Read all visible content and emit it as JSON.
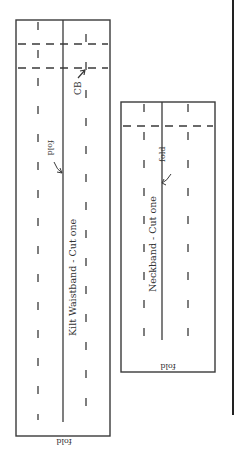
{
  "diagram": {
    "type": "sewing-pattern-pieces",
    "colors": {
      "line": "#3a3a3a",
      "background": "#ffffff"
    },
    "pieces": [
      {
        "id": "kilt-waistband",
        "title": "Kilt Waistband - Cut one",
        "center_back_label": "CB",
        "fold_label_side": "fold",
        "fold_label_bottom": "fold"
      },
      {
        "id": "neckband",
        "title": "Neckband - Cut one",
        "fold_label_side": "fold",
        "fold_label_bottom": "fold"
      }
    ]
  }
}
